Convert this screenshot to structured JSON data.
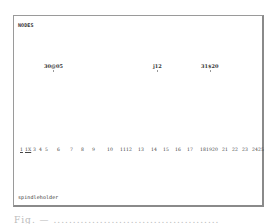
{
  "frame": {
    "top_label": "NODES",
    "bottom_label": "spindleholder"
  },
  "markers": [
    {
      "label": "30@05",
      "x": 30
    },
    {
      "label": "j12",
      "x": 139
    },
    {
      "label": "31$20",
      "x": 187
    }
  ],
  "axis": {
    "ticks": [
      {
        "label": "1",
        "x": 0,
        "underline": true
      },
      {
        "label": "1X",
        "x": 5,
        "underline": true
      },
      {
        "label": "3",
        "x": 13,
        "underline": false
      },
      {
        "label": "4",
        "x": 19,
        "underline": false
      },
      {
        "label": "5",
        "x": 25,
        "underline": false
      },
      {
        "label": "6",
        "x": 37,
        "underline": false
      },
      {
        "label": "7",
        "x": 50,
        "underline": false
      },
      {
        "label": "8",
        "x": 61,
        "underline": false
      },
      {
        "label": "9",
        "x": 72,
        "underline": false
      },
      {
        "label": "10",
        "x": 87,
        "underline": false
      },
      {
        "label": "11",
        "x": 100,
        "underline": false
      },
      {
        "label": "12",
        "x": 106,
        "underline": false
      },
      {
        "label": "13",
        "x": 118,
        "underline": false
      },
      {
        "label": "14",
        "x": 131,
        "underline": false
      },
      {
        "label": "15",
        "x": 143,
        "underline": false
      },
      {
        "label": "16",
        "x": 155,
        "underline": false
      },
      {
        "label": "17",
        "x": 167,
        "underline": false
      },
      {
        "label": "18",
        "x": 180,
        "underline": false
      },
      {
        "label": "19",
        "x": 186,
        "underline": false
      },
      {
        "label": "20",
        "x": 192,
        "underline": false
      },
      {
        "label": "21",
        "x": 202,
        "underline": false
      },
      {
        "label": "22",
        "x": 212,
        "underline": false
      },
      {
        "label": "23",
        "x": 222,
        "underline": false
      },
      {
        "label": "24",
        "x": 232,
        "underline": false
      },
      {
        "label": "25",
        "x": 238,
        "underline": false
      }
    ]
  },
  "caption": "Fig. — ..........................................."
}
